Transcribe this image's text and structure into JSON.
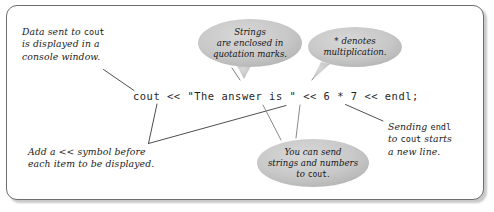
{
  "figure": {
    "type": "annotated-code-diagram",
    "border_color": "#6e6e6e",
    "oval_fill": "#c9c9c9",
    "leader_line_color": "#3a3a3a",
    "background": "#ffffff"
  },
  "code": {
    "statement": "cout << \"The answer is \" << 6 * 7 << endl;"
  },
  "annotations": {
    "top_left": {
      "line1_a": "Data sent to ",
      "line1_code": "cout",
      "line2": "is displayed in a",
      "line3": "console window."
    },
    "bottom_left": {
      "line1": "Add a << symbol before",
      "line2": "each item to be displayed."
    },
    "right": {
      "line1_a": "Sending ",
      "line1_code": "endl",
      "line2_a": "to ",
      "line2_code": "cout",
      "line2_b": " starts",
      "line3": "a new line."
    }
  },
  "callouts": [
    {
      "id": "strings-callout",
      "line1": "Strings",
      "line2": "are enclosed in",
      "line3": "quotation marks."
    },
    {
      "id": "multiplication-callout",
      "line1": "* denotes",
      "line2": "multiplication."
    },
    {
      "id": "send-callout",
      "line1": "You can send",
      "line2": "strings and numbers",
      "line3_a": "to ",
      "line3_code": "cout",
      "line3_b": "."
    }
  ]
}
